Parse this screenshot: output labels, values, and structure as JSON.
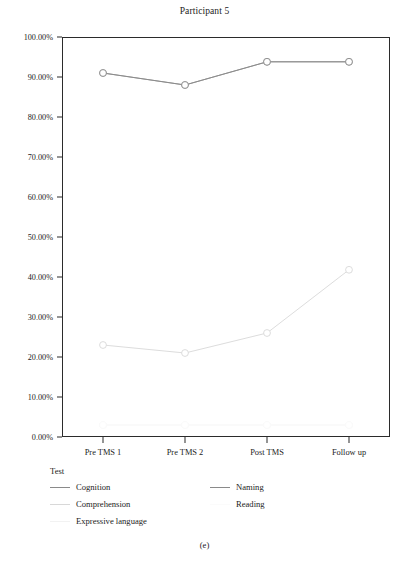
{
  "figure": {
    "caption": "(e)"
  },
  "chart_data": {
    "type": "line",
    "title": "Participant 5",
    "xlabel": "",
    "ylabel": "",
    "categories": [
      "Pre TMS 1",
      "Pre TMS 2",
      "Post TMS",
      "Follow up"
    ],
    "ylim": [
      0,
      100
    ],
    "ytick_labels": [
      "0.00%",
      "10.00%",
      "20.00%",
      "30.00%",
      "40.00%",
      "50.00%",
      "60.00%",
      "70.00%",
      "80.00%",
      "90.00%",
      "100.00%"
    ],
    "ytick_values": [
      0,
      10,
      20,
      30,
      40,
      50,
      60,
      70,
      80,
      90,
      100
    ],
    "grid": false,
    "legend_position": "below-left",
    "legend_title": "Test",
    "marker": "open-circle",
    "series": [
      {
        "name": "Cognition",
        "color": "#8a8a8a",
        "values": [
          91.0,
          88.0,
          93.8,
          93.8
        ]
      },
      {
        "name": "Comprehension",
        "color": "#d8d8d8",
        "values": [
          23.0,
          21.0,
          26.0,
          41.8
        ]
      },
      {
        "name": "Expressive language",
        "color": "#f2f2f2",
        "values": [
          3.0,
          3.0,
          3.0,
          3.0
        ]
      },
      {
        "name": "Naming",
        "color": "#8a8a8a",
        "values": [
          91.0,
          88.0,
          93.8,
          93.8
        ]
      },
      {
        "name": "Reading",
        "color": "#fbfbfb",
        "values": [
          3.0,
          3.0,
          3.0,
          3.0
        ]
      }
    ]
  }
}
